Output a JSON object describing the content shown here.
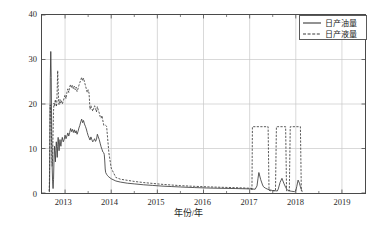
{
  "chart_data": {
    "type": "line",
    "title": "",
    "xlabel": "年份/年",
    "ylabel": "日产油量、日产液量/(m³·d⁻¹)",
    "ylabel_parts": {
      "main": "日产油量、日产液量/(m",
      "sup1": "3",
      "mid": " · d",
      "sup2": "-1",
      "tail": ")"
    },
    "xlim": [
      2012.5,
      2019.5
    ],
    "ylim": [
      0,
      40
    ],
    "xticks": [
      2013,
      2014,
      2015,
      2016,
      2017,
      2018,
      2019
    ],
    "xtick_labels": [
      "2013",
      "2014",
      "2015",
      "2016",
      "2017",
      "2018",
      "2019"
    ],
    "yticks": [
      0,
      10,
      20,
      30,
      40
    ],
    "ytick_labels": [
      "0",
      "10",
      "20",
      "30",
      "40"
    ],
    "grid": true,
    "grid_color": "#c8c8c8",
    "axis_color": "#4a4a4a",
    "legend_position": "top-right",
    "series": [
      {
        "name": "日产油量",
        "style": "solid",
        "color": "#3a3a3a",
        "x": [
          2012.66,
          2012.665,
          2012.67,
          2012.675,
          2012.68,
          2012.69,
          2012.7,
          2012.71,
          2012.72,
          2012.73,
          2012.74,
          2012.75,
          2012.76,
          2012.77,
          2012.78,
          2012.79,
          2012.8,
          2012.81,
          2012.82,
          2012.83,
          2012.84,
          2012.85,
          2012.86,
          2012.87,
          2012.88,
          2012.89,
          2012.9,
          2012.91,
          2012.92,
          2012.94,
          2012.96,
          2012.98,
          2013.0,
          2013.02,
          2013.04,
          2013.06,
          2013.08,
          2013.1,
          2013.12,
          2013.14,
          2013.16,
          2013.18,
          2013.2,
          2013.22,
          2013.24,
          2013.26,
          2013.28,
          2013.3,
          2013.32,
          2013.34,
          2013.36,
          2013.38,
          2013.4,
          2013.42,
          2013.44,
          2013.46,
          2013.48,
          2013.5,
          2013.52,
          2013.54,
          2013.56,
          2013.58,
          2013.6,
          2013.62,
          2013.64,
          2013.66,
          2013.68,
          2013.7,
          2013.72,
          2013.74,
          2013.76,
          2013.78,
          2013.8,
          2013.82,
          2013.84,
          2013.85,
          2013.86,
          2013.87,
          2013.88,
          2013.9,
          2013.92,
          2013.95,
          2014.0,
          2014.1,
          2014.2,
          2014.35,
          2014.5,
          2014.7,
          2014.9,
          2015.1,
          2015.3,
          2015.5,
          2015.8,
          2016.1,
          2016.4,
          2016.7,
          2016.9,
          2017.05,
          2017.12,
          2017.16,
          2017.18,
          2017.2,
          2017.24,
          2017.28,
          2017.3,
          2017.34,
          2017.38,
          2017.42,
          2017.46,
          2017.5,
          2017.56,
          2017.6,
          2017.62,
          2017.66,
          2017.7,
          2017.74,
          2017.78,
          2017.8,
          2017.82,
          2017.86,
          2017.9,
          2017.94,
          2017.97,
          2018.0,
          2018.02,
          2018.05,
          2018.08,
          2018.1,
          2018.12,
          2018.14
        ],
        "y": [
          0.2,
          3.0,
          9.0,
          18.0,
          26.0,
          31.8,
          26.0,
          14.0,
          6.0,
          2.5,
          1.0,
          3.0,
          7.5,
          10.5,
          9.0,
          7.0,
          9.5,
          11.5,
          10.0,
          8.0,
          10.5,
          12.5,
          11.0,
          9.5,
          11.0,
          12.0,
          11.0,
          10.5,
          11.5,
          12.5,
          11.5,
          12.0,
          13.0,
          12.2,
          12.8,
          13.5,
          12.8,
          13.6,
          14.5,
          13.8,
          14.3,
          13.6,
          14.2,
          13.5,
          14.0,
          13.2,
          13.8,
          14.6,
          15.2,
          16.0,
          16.6,
          15.8,
          16.3,
          15.5,
          15.0,
          14.4,
          13.6,
          12.9,
          12.4,
          11.9,
          12.6,
          12.0,
          11.5,
          11.8,
          12.2,
          11.6,
          12.0,
          13.2,
          12.6,
          12.0,
          11.2,
          10.4,
          9.8,
          9.2,
          9.0,
          8.6,
          7.2,
          5.4,
          4.6,
          4.2,
          3.9,
          3.6,
          3.2,
          2.7,
          2.45,
          2.2,
          2.05,
          1.85,
          1.7,
          1.55,
          1.45,
          1.35,
          1.22,
          1.12,
          1.05,
          1.0,
          0.95,
          0.9,
          0.85,
          1.6,
          3.2,
          4.6,
          3.0,
          1.8,
          1.4,
          1.1,
          0.9,
          0.75,
          0.65,
          0.55,
          0.5,
          0.45,
          0.9,
          2.4,
          3.3,
          2.2,
          1.3,
          0.9,
          0.7,
          0.5,
          0.4,
          0.35,
          0.3,
          0.5,
          1.4,
          2.9,
          2.2,
          1.4,
          0.8,
          0.35
        ]
      },
      {
        "name": "日产液量",
        "style": "dashed",
        "color": "#3a3a3a",
        "x": [
          2012.655,
          2012.66,
          2012.665,
          2012.67,
          2012.675,
          2012.68,
          2012.685,
          2012.69,
          2012.7,
          2012.71,
          2012.72,
          2012.73,
          2012.74,
          2012.75,
          2012.76,
          2012.77,
          2012.78,
          2012.79,
          2012.8,
          2012.81,
          2012.82,
          2012.83,
          2012.84,
          2012.85,
          2012.86,
          2012.87,
          2012.88,
          2012.89,
          2012.9,
          2012.92,
          2012.94,
          2012.96,
          2012.98,
          2013.0,
          2013.02,
          2013.04,
          2013.06,
          2013.08,
          2013.1,
          2013.12,
          2013.14,
          2013.16,
          2013.18,
          2013.2,
          2013.22,
          2013.24,
          2013.26,
          2013.28,
          2013.3,
          2013.32,
          2013.34,
          2013.36,
          2013.38,
          2013.4,
          2013.42,
          2013.44,
          2013.46,
          2013.48,
          2013.5,
          2013.52,
          2013.54,
          2013.56,
          2013.58,
          2013.6,
          2013.62,
          2013.64,
          2013.66,
          2013.68,
          2013.7,
          2013.72,
          2013.74,
          2013.76,
          2013.78,
          2013.8,
          2013.82,
          2013.84,
          2013.85,
          2013.86,
          2013.88,
          2013.9,
          2013.95,
          2014.0,
          2014.1,
          2014.2,
          2014.35,
          2014.5,
          2014.7,
          2014.9,
          2015.1,
          2015.3,
          2015.5,
          2015.8,
          2016.1,
          2016.4,
          2016.7,
          2016.9,
          2017.04,
          2017.05,
          2017.06,
          2017.4,
          2017.42,
          2017.44,
          2017.46,
          2017.56,
          2017.58,
          2017.6,
          2017.78,
          2017.8,
          2017.82,
          2017.86,
          2017.88,
          2017.9,
          2017.92,
          2018.1,
          2018.12,
          2018.14
        ],
        "y": [
          0.4,
          2.0,
          6.0,
          13.0,
          19.5,
          19.8,
          19.0,
          18.0,
          15.0,
          10.0,
          6.0,
          8.0,
          13.5,
          18.5,
          20.2,
          19.6,
          20.4,
          21.0,
          20.2,
          19.4,
          20.0,
          23.5,
          27.5,
          24.0,
          20.5,
          19.8,
          20.4,
          21.0,
          20.2,
          20.8,
          20.0,
          20.6,
          21.4,
          22.0,
          21.2,
          22.6,
          23.4,
          22.6,
          23.8,
          24.4,
          23.6,
          24.2,
          23.4,
          24.0,
          23.2,
          23.8,
          22.8,
          23.4,
          24.2,
          24.8,
          25.4,
          26.0,
          25.2,
          25.8,
          25.0,
          24.2,
          23.4,
          22.6,
          23.2,
          22.4,
          18.8,
          19.6,
          19.0,
          18.4,
          19.0,
          19.6,
          19.0,
          18.2,
          19.4,
          18.6,
          18.0,
          17.2,
          16.8,
          17.4,
          16.2,
          15.2,
          15.2,
          15.2,
          15.2,
          15.0,
          9.0,
          5.6,
          3.5,
          3.1,
          2.85,
          2.6,
          2.35,
          2.15,
          1.95,
          1.8,
          1.65,
          1.5,
          1.38,
          1.28,
          1.2,
          1.12,
          1.05,
          0.6,
          14.9,
          14.9,
          0.6,
          0.55,
          0.5,
          0.5,
          14.9,
          14.9,
          14.9,
          0.5,
          0.45,
          0.45,
          14.9,
          14.9,
          14.9,
          14.9,
          0.5,
          0.35
        ]
      }
    ]
  },
  "legend": {
    "items": [
      {
        "label": "日产油量",
        "style": "solid"
      },
      {
        "label": "日产液量",
        "style": "dashed"
      }
    ]
  }
}
